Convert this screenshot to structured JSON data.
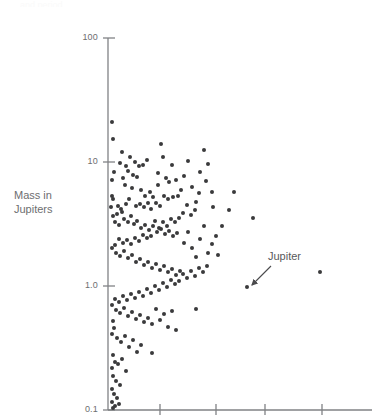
{
  "figure": {
    "background_color": "#ffffff",
    "axis_color": "#808285",
    "point_color": "#3a3a3c",
    "text_color": "#6d6e70",
    "top_cutoff_text": "and period"
  },
  "axes": {
    "ylabel_text": "Mass in\nJupiters",
    "y_ticks": [
      {
        "label": "100",
        "value": 100,
        "py": 38
      },
      {
        "label": "10",
        "value": 10,
        "py": 162
      },
      {
        "label": "1.0",
        "value": 1.0,
        "py": 286
      },
      {
        "label": "0.1",
        "value": 0.1,
        "py": 410
      }
    ],
    "x_ticks": [
      {
        "label": "",
        "px": 160
      },
      {
        "label": "",
        "px": 216
      },
      {
        "label": "",
        "px": 265
      },
      {
        "label": "",
        "px": 322
      }
    ],
    "x_axis_y": 410,
    "y_axis_x": 108,
    "plot_left": 108,
    "plot_right": 372,
    "plot_top": 38,
    "plot_bottom": 410
  },
  "annotations": [
    {
      "name": "jupiter-annotation",
      "label": "Jupiter",
      "text_x": 268,
      "text_y": 250,
      "arrow_from_x": 271,
      "arrow_from_y": 266,
      "arrow_to_x": 252,
      "arrow_to_y": 285
    }
  ],
  "chart_data": {
    "type": "scatter",
    "title": "",
    "xlabel": "",
    "ylabel": "Mass in Jupiters",
    "yscale": "log",
    "ylim": [
      0.1,
      100
    ],
    "grid": false,
    "legend": null,
    "ytick_labels": [
      "100",
      "10",
      "1.0",
      "0.1"
    ],
    "ytick_values": [
      100,
      10,
      1.0,
      0.1
    ],
    "xtick_labels": [
      "",
      "",
      "",
      ""
    ],
    "marker": "circle",
    "marker_color": "#3a3a3c",
    "marker_size_px": 4,
    "n_points": 182,
    "note": "Points given as pixel coordinates (px, py) within the 372x420 canvas; y maps log-scale 0.1 at py=410 to 100 at py=38 (124 px per decade).",
    "points": [
      [
        112,
        122
      ],
      [
        113,
        139
      ],
      [
        122,
        152
      ],
      [
        120,
        163
      ],
      [
        114,
        172
      ],
      [
        126,
        166
      ],
      [
        112,
        180
      ],
      [
        123,
        178
      ],
      [
        112,
        196
      ],
      [
        113,
        199
      ],
      [
        111,
        207
      ],
      [
        125,
        185
      ],
      [
        118,
        206
      ],
      [
        121,
        209
      ],
      [
        130,
        157
      ],
      [
        128,
        171
      ],
      [
        135,
        162
      ],
      [
        139,
        166
      ],
      [
        143,
        165
      ],
      [
        147,
        160
      ],
      [
        133,
        175
      ],
      [
        137,
        177
      ],
      [
        141,
        190
      ],
      [
        132,
        188
      ],
      [
        145,
        196
      ],
      [
        150,
        192
      ],
      [
        153,
        197
      ],
      [
        158,
        173
      ],
      [
        161,
        144
      ],
      [
        163,
        157
      ],
      [
        166,
        178
      ],
      [
        158,
        185
      ],
      [
        169,
        182
      ],
      [
        172,
        165
      ],
      [
        176,
        180
      ],
      [
        164,
        196
      ],
      [
        168,
        199
      ],
      [
        173,
        197
      ],
      [
        178,
        196
      ],
      [
        156,
        203
      ],
      [
        160,
        206
      ],
      [
        148,
        203
      ],
      [
        151,
        209
      ],
      [
        140,
        204
      ],
      [
        144,
        207
      ],
      [
        136,
        206
      ],
      [
        129,
        199
      ],
      [
        126,
        204
      ],
      [
        122,
        212
      ],
      [
        117,
        214
      ],
      [
        113,
        216
      ],
      [
        115,
        222
      ],
      [
        119,
        225
      ],
      [
        124,
        219
      ],
      [
        128,
        222
      ],
      [
        131,
        216
      ],
      [
        134,
        224
      ],
      [
        137,
        221
      ],
      [
        141,
        228
      ],
      [
        145,
        225
      ],
      [
        149,
        230
      ],
      [
        153,
        226
      ],
      [
        157,
        232
      ],
      [
        161,
        229
      ],
      [
        165,
        234
      ],
      [
        169,
        231
      ],
      [
        173,
        236
      ],
      [
        177,
        233
      ],
      [
        181,
        190
      ],
      [
        184,
        176
      ],
      [
        188,
        161
      ],
      [
        192,
        187
      ],
      [
        196,
        202
      ],
      [
        200,
        172
      ],
      [
        204,
        150
      ],
      [
        208,
        164
      ],
      [
        212,
        192
      ],
      [
        206,
        181
      ],
      [
        199,
        193
      ],
      [
        195,
        210
      ],
      [
        191,
        215
      ],
      [
        187,
        205
      ],
      [
        183,
        213
      ],
      [
        179,
        218
      ],
      [
        175,
        222
      ],
      [
        171,
        219
      ],
      [
        167,
        226
      ],
      [
        163,
        222
      ],
      [
        159,
        228
      ],
      [
        155,
        221
      ],
      [
        151,
        236
      ],
      [
        147,
        238
      ],
      [
        143,
        235
      ],
      [
        139,
        241
      ],
      [
        135,
        238
      ],
      [
        131,
        244
      ],
      [
        127,
        240
      ],
      [
        123,
        243
      ],
      [
        119,
        239
      ],
      [
        115,
        245
      ],
      [
        112,
        248
      ],
      [
        116,
        253
      ],
      [
        120,
        256
      ],
      [
        124,
        251
      ],
      [
        128,
        258
      ],
      [
        132,
        255
      ],
      [
        136,
        262
      ],
      [
        140,
        259
      ],
      [
        144,
        265
      ],
      [
        148,
        262
      ],
      [
        152,
        268
      ],
      [
        156,
        264
      ],
      [
        160,
        270
      ],
      [
        164,
        266
      ],
      [
        168,
        272
      ],
      [
        172,
        269
      ],
      [
        176,
        275
      ],
      [
        180,
        271
      ],
      [
        184,
        243
      ],
      [
        188,
        232
      ],
      [
        192,
        248
      ],
      [
        196,
        257
      ],
      [
        200,
        239
      ],
      [
        204,
        226
      ],
      [
        208,
        253
      ],
      [
        212,
        244
      ],
      [
        216,
        236
      ],
      [
        207,
        266
      ],
      [
        203,
        272
      ],
      [
        199,
        268
      ],
      [
        195,
        276
      ],
      [
        191,
        271
      ],
      [
        187,
        278
      ],
      [
        183,
        274
      ],
      [
        179,
        281
      ],
      [
        175,
        284
      ],
      [
        171,
        280
      ],
      [
        167,
        287
      ],
      [
        163,
        283
      ],
      [
        159,
        290
      ],
      [
        155,
        286
      ],
      [
        151,
        293
      ],
      [
        147,
        289
      ],
      [
        143,
        296
      ],
      [
        139,
        292
      ],
      [
        135,
        298
      ],
      [
        131,
        294
      ],
      [
        127,
        300
      ],
      [
        123,
        296
      ],
      [
        119,
        302
      ],
      [
        115,
        299
      ],
      [
        112,
        305
      ],
      [
        116,
        310
      ],
      [
        120,
        313
      ],
      [
        124,
        308
      ],
      [
        128,
        316
      ],
      [
        132,
        312
      ],
      [
        136,
        319
      ],
      [
        140,
        315
      ],
      [
        144,
        322
      ],
      [
        148,
        318
      ],
      [
        152,
        324
      ],
      [
        156,
        309
      ],
      [
        160,
        320
      ],
      [
        164,
        314
      ],
      [
        168,
        327
      ],
      [
        172,
        311
      ],
      [
        176,
        330
      ],
      [
        113,
        321
      ],
      [
        114,
        328
      ],
      [
        112,
        334
      ],
      [
        117,
        338
      ],
      [
        121,
        342
      ],
      [
        125,
        336
      ],
      [
        129,
        347
      ],
      [
        133,
        340
      ],
      [
        137,
        352
      ],
      [
        141,
        345
      ],
      [
        113,
        355
      ],
      [
        115,
        362
      ],
      [
        112,
        368
      ],
      [
        118,
        364
      ],
      [
        122,
        359
      ],
      [
        126,
        371
      ],
      [
        113,
        376
      ],
      [
        116,
        381
      ],
      [
        120,
        385
      ],
      [
        112,
        389
      ],
      [
        114,
        394
      ],
      [
        117,
        398
      ],
      [
        112,
        402
      ],
      [
        115,
        406
      ],
      [
        113,
        408
      ],
      [
        119,
        404
      ],
      [
        152,
        353
      ],
      [
        196,
        309
      ],
      [
        247,
        287
      ],
      [
        320,
        272
      ],
      [
        253,
        218
      ],
      [
        222,
        226
      ],
      [
        229,
        210
      ],
      [
        234,
        192
      ],
      [
        218,
        255
      ],
      [
        213,
        207
      ]
    ]
  }
}
